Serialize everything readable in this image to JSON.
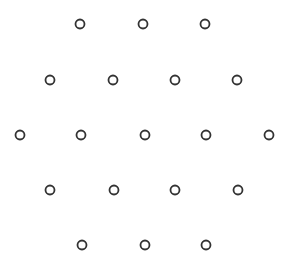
{
  "pattern": {
    "description": "hexagonal arrangement of hollow circles",
    "stroke_color": "#333333",
    "fill_color": "#ffffff",
    "radius": 4.5,
    "stroke_width": 1.8,
    "rows": [
      {
        "y": 24,
        "xs": [
          80,
          143,
          205
        ]
      },
      {
        "y": 80,
        "xs": [
          50,
          113,
          175,
          237
        ]
      },
      {
        "y": 135,
        "xs": [
          20,
          81,
          145,
          206,
          269
        ]
      },
      {
        "y": 190,
        "xs": [
          50,
          114,
          175,
          238
        ]
      },
      {
        "y": 245,
        "xs": [
          82,
          145,
          206
        ]
      }
    ]
  }
}
